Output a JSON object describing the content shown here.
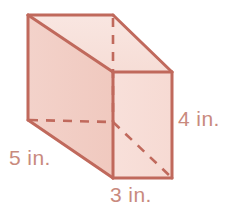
{
  "figure": {
    "name": "rectangular-prism-diagram",
    "shape": "rectangular prism",
    "unit": "in.",
    "colors": {
      "edge_stroke": "#c0695c",
      "top_face_fill": "#f8e2dd",
      "left_face_fill": "#f2cdc4",
      "front_face_fill": "#f7dcd5",
      "label_text": "#c98a7e",
      "background": "#ffffff"
    },
    "labels": {
      "width": "3 in.",
      "height": "4 in.",
      "depth": "5 in."
    },
    "dimensions": {
      "width_value": 3,
      "height_value": 4,
      "depth_value": 5
    },
    "faces": [
      {
        "id": "top-face",
        "name": "top-face",
        "points": "28,15 113,15 172,72 113,72"
      },
      {
        "id": "left-face",
        "name": "left-face",
        "points": "28,15 113,72 113,178 28,120"
      },
      {
        "id": "front-face",
        "name": "front-face",
        "points": "113,72 172,72 172,178 113,178"
      }
    ],
    "solid_edges": [
      {
        "name": "edge-top-back",
        "x1": 28,
        "y1": 15,
        "x2": 113,
        "y2": 15
      },
      {
        "name": "edge-top-right-slant",
        "x1": 113,
        "y1": 15,
        "x2": 172,
        "y2": 72
      },
      {
        "name": "edge-top-left-slant",
        "x1": 28,
        "y1": 15,
        "x2": 113,
        "y2": 72
      },
      {
        "name": "edge-left-vertical",
        "x1": 28,
        "y1": 15,
        "x2": 28,
        "y2": 120
      },
      {
        "name": "edge-front-left-vert",
        "x1": 113,
        "y1": 72,
        "x2": 113,
        "y2": 178
      },
      {
        "name": "edge-front-right-vert",
        "x1": 172,
        "y1": 72,
        "x2": 172,
        "y2": 178
      },
      {
        "name": "edge-front-top",
        "x1": 113,
        "y1": 72,
        "x2": 172,
        "y2": 72
      },
      {
        "name": "edge-front-bottom",
        "x1": 113,
        "y1": 178,
        "x2": 172,
        "y2": 178
      },
      {
        "name": "edge-bottom-left-slant",
        "x1": 28,
        "y1": 120,
        "x2": 113,
        "y2": 178
      }
    ],
    "hidden_edges": [
      {
        "name": "hidden-edge-vertical",
        "x1": 113,
        "y1": 15,
        "x2": 113,
        "y2": 122
      },
      {
        "name": "hidden-edge-horizontal",
        "x1": 28,
        "y1": 120,
        "x2": 113,
        "y2": 122
      },
      {
        "name": "hidden-edge-diagonal",
        "x1": 113,
        "y1": 122,
        "x2": 172,
        "y2": 178
      }
    ]
  }
}
